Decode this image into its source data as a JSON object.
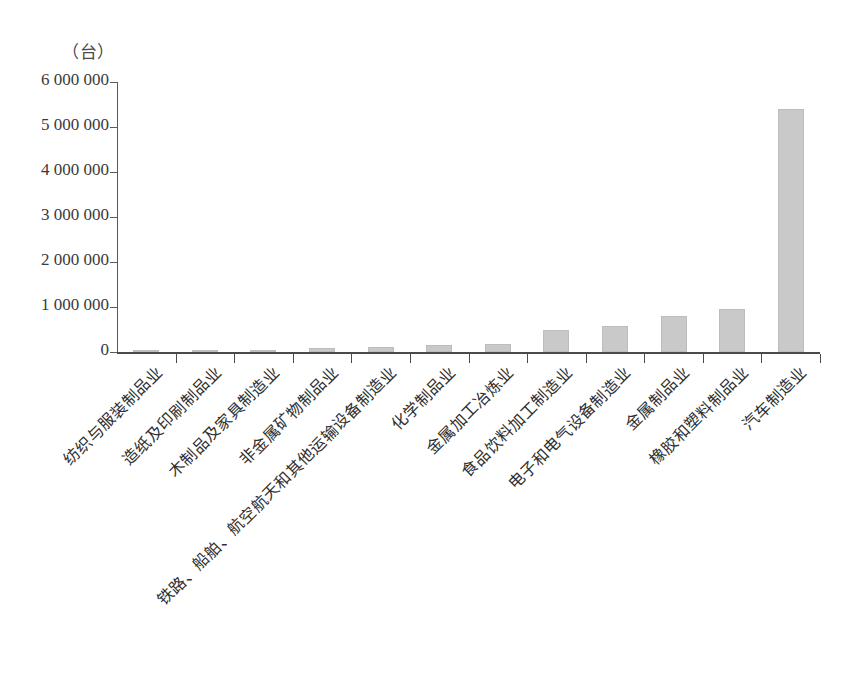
{
  "chart_data": {
    "type": "bar",
    "title": "",
    "subtitle": "",
    "unit_label": "（台）",
    "xlabel": "",
    "ylabel": "",
    "ylim": [
      0,
      6000000
    ],
    "grid": false,
    "legend": false,
    "y_ticks": [
      0,
      1000000,
      2000000,
      3000000,
      4000000,
      5000000,
      6000000
    ],
    "y_tick_labels": [
      "0",
      "1 000 000",
      "2 000 000",
      "3 000 000",
      "4 000 000",
      "5 000 000",
      "6 000 000"
    ],
    "categories": [
      "纺织与服装制品业",
      "造纸及印刷制品业",
      "木制品及家具制造业",
      "非金属矿物制品业",
      "铁路、船舶、航空航天和其他运输设备制造业",
      "化学制品业",
      "金属加工冶炼业",
      "食品饮料加工制造业",
      "电子和电气设备制造业",
      "金属制品业",
      "橡胶和塑料制品业",
      "汽车制造业"
    ],
    "values": [
      8000,
      15000,
      25000,
      90000,
      120000,
      155000,
      185000,
      490000,
      570000,
      810000,
      950000,
      5400000
    ],
    "bar_color": "#c9c9c9",
    "axis_color": "#4a4a4a"
  }
}
